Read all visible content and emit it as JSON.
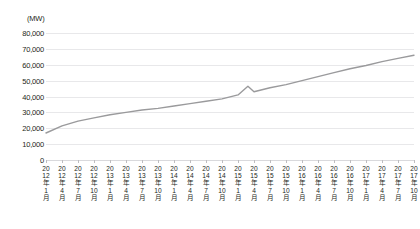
{
  "chart_data": {
    "type": "line",
    "title": "",
    "subtitle": "",
    "unit_label": "(MW)",
    "xlabel": "",
    "ylabel": "",
    "ylim": [
      0,
      80000
    ],
    "y_ticks": [
      "0",
      "10,000",
      "20,000",
      "30,000",
      "40,000",
      "50,000",
      "60,000",
      "70,000",
      "80,000"
    ],
    "y_tick_values": [
      0,
      10000,
      20000,
      30000,
      40000,
      50000,
      60000,
      70000,
      80000
    ],
    "grid": true,
    "legend": false,
    "legend_position": "none",
    "line_color": "#9a9a9c",
    "categories": [
      "2012年1月",
      "2012年4月",
      "2012年7月",
      "2012年10月",
      "2013年1月",
      "2013年4月",
      "2013年7月",
      "2013年10月",
      "2014年1月",
      "2014年4月",
      "2014年7月",
      "2014年10月",
      "2015年1月",
      "2015年4月",
      "2015年7月",
      "2015年10月",
      "2016年1月",
      "2016年4月",
      "2016年7月",
      "2016年10月",
      "2017年1月",
      "2017年4月",
      "2017年7月",
      "2017年10月"
    ],
    "values": [
      17000,
      21500,
      24500,
      26500,
      28500,
      30000,
      31500,
      32500,
      34000,
      35500,
      37000,
      38500,
      41000,
      43000,
      45500,
      47500,
      50000,
      52500,
      55000,
      57500,
      59500,
      62000,
      64000,
      66000
    ],
    "annotations": [
      {
        "label": "spike-and-dip near 2015年4月",
        "category": "2015年4月",
        "peak_value": 46500,
        "trough_value": 43000
      }
    ]
  }
}
